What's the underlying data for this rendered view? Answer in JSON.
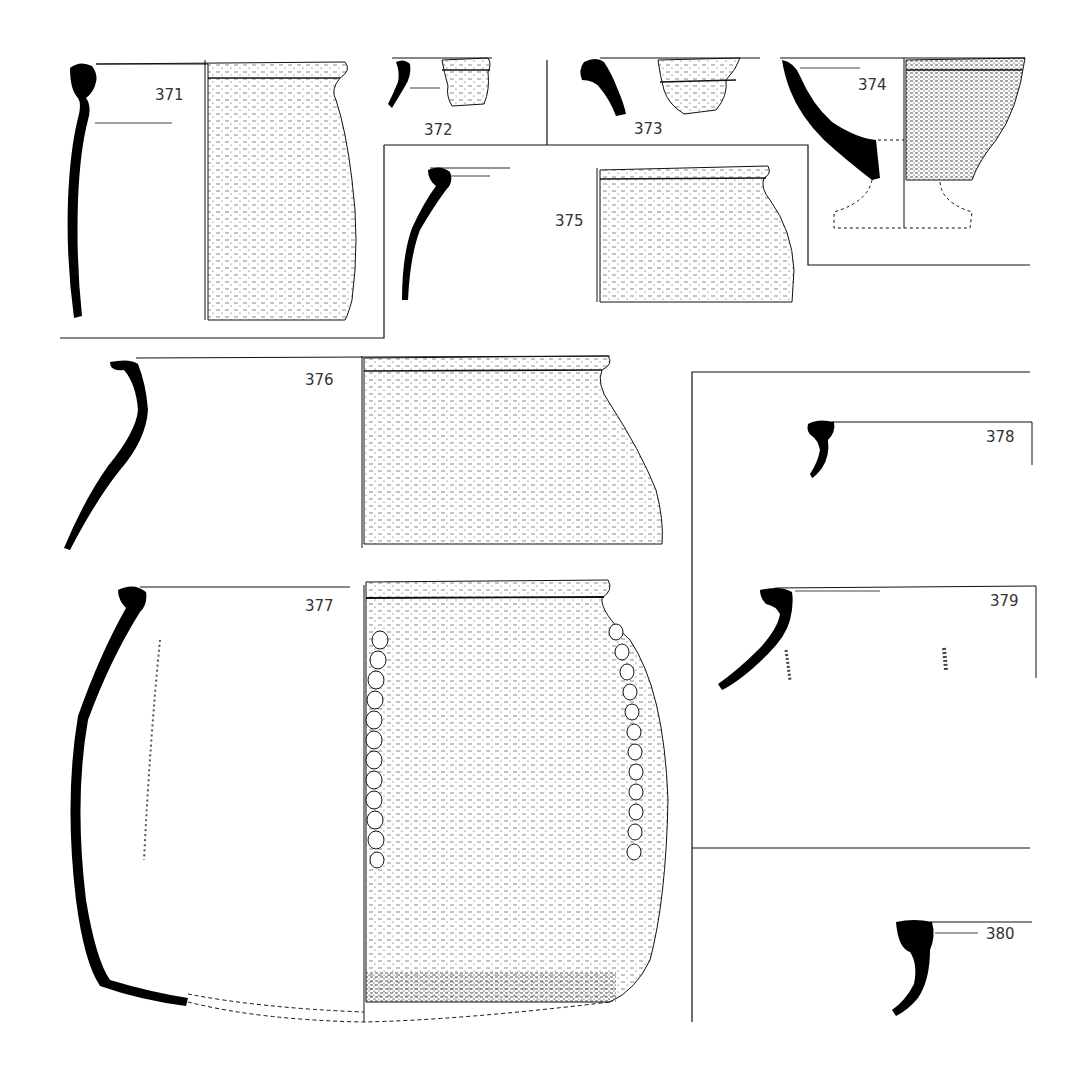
{
  "plate": {
    "type": "pottery profile drawings",
    "ink_color": "#000000",
    "paper_color": "#ffffff",
    "vessels": [
      {
        "id": "371",
        "label": "371",
        "form": "jar with everted rim"
      },
      {
        "id": "372",
        "label": "372",
        "form": "rim sherd"
      },
      {
        "id": "373",
        "label": "373",
        "form": "rim sherd"
      },
      {
        "id": "374",
        "label": "374",
        "form": "footed goblet / chalice"
      },
      {
        "id": "375",
        "label": "375",
        "form": "jar with everted rim"
      },
      {
        "id": "376",
        "label": "376",
        "form": "large jar"
      },
      {
        "id": "377",
        "label": "377",
        "form": "large jar with applied rope decoration"
      },
      {
        "id": "378",
        "label": "378",
        "form": "rim profile"
      },
      {
        "id": "379",
        "label": "379",
        "form": "rim profile"
      },
      {
        "id": "380",
        "label": "380",
        "form": "rim profile"
      }
    ]
  }
}
